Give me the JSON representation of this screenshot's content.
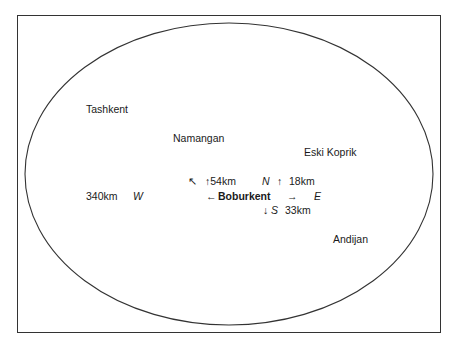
{
  "diagram": {
    "type": "region-map",
    "center_city": "Boburkent",
    "cities": {
      "tashkent": "Tashkent",
      "namangan": "Namangan",
      "eski_koprik": "Eski Koprik",
      "andijan": "Andijan"
    },
    "directions": {
      "nw_arrow": "↖",
      "north_distance": "↑54km",
      "north_label": "N",
      "north_arrow": "↑",
      "north_east_distance": "18km",
      "west_distance": "340km",
      "west_label": "W",
      "west_arrow": "←",
      "east_arrow": "→",
      "east_label": "E",
      "south_arrow": "↓",
      "south_label": "S",
      "south_distance": "33km"
    },
    "colors": {
      "stroke": "#333333",
      "text": "#1a1a1a",
      "background": "#ffffff"
    }
  }
}
